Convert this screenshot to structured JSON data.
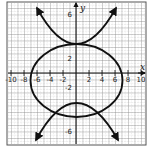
{
  "figure": {
    "type": "coordinate-plane-graph",
    "axes": {
      "x_label": "x",
      "y_label": "y",
      "x_tick_labels": [
        "-10",
        "-8",
        "-6",
        "-4",
        "-2",
        "2",
        "4",
        "6",
        "8",
        "10"
      ],
      "x_tick_values": [
        -10,
        -8,
        -6,
        -4,
        -2,
        2,
        4,
        6,
        8,
        10
      ],
      "y_tick_labels": [
        "6",
        "2",
        "-2",
        "-6"
      ],
      "y_tick_values": [
        9,
        2,
        -2,
        -9
      ],
      "x_range": [
        -10,
        10
      ],
      "y_range": [
        -10,
        10
      ],
      "grid": true
    },
    "curves": [
      {
        "name": "upper-parabola",
        "kind": "parabola",
        "opens": "up",
        "vertex": [
          0,
          4
        ],
        "arrows": true
      },
      {
        "name": "ellipse",
        "kind": "ellipse",
        "center": [
          0,
          -1
        ],
        "semi_x": 7,
        "semi_y": 5.5
      },
      {
        "name": "lower-parabola",
        "kind": "parabola",
        "opens": "down",
        "vertex": [
          0,
          -4.5
        ],
        "arrows": true
      }
    ],
    "colors": {
      "curve": "#111111",
      "grid": "#9a9a9a",
      "axis": "#111111",
      "frame": "#444444"
    }
  }
}
